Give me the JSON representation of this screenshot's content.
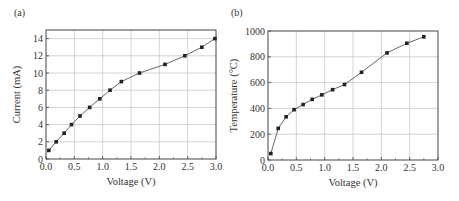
{
  "chart_data": [
    {
      "type": "line",
      "panel_label": "(a)",
      "title": "",
      "xlabel": "Voltage (V)",
      "ylabel": "Current (mA)",
      "xlim": [
        0.0,
        3.0
      ],
      "ylim": [
        0,
        15
      ],
      "xticks": [
        "0.0",
        "0.5",
        "1.0",
        "1.5",
        "2.0",
        "2.5",
        "3.0"
      ],
      "yticks": [
        "0",
        "2",
        "4",
        "6",
        "8",
        "10",
        "12",
        "14"
      ],
      "grid": true,
      "legend": null,
      "series": [
        {
          "name": "Current",
          "marker": "square",
          "x": [
            0.05,
            0.18,
            0.32,
            0.45,
            0.6,
            0.77,
            0.95,
            1.13,
            1.33,
            1.65,
            2.1,
            2.45,
            2.75,
            2.98
          ],
          "y": [
            1,
            2,
            3,
            4,
            5,
            6,
            7,
            8,
            9,
            10,
            11,
            12,
            13,
            14
          ]
        }
      ]
    },
    {
      "type": "line",
      "panel_label": "(b)",
      "title": "",
      "xlabel": "Voltage (V)",
      "ylabel": "Temperature (°C)",
      "xlim": [
        0.0,
        3.0
      ],
      "ylim": [
        0,
        1000
      ],
      "xticks": [
        "0.0",
        "0.5",
        "1.0",
        "1.5",
        "2.0",
        "2.5",
        "3.0"
      ],
      "yticks": [
        "0",
        "200",
        "400",
        "600",
        "800",
        "1000"
      ],
      "grid": true,
      "legend": null,
      "series": [
        {
          "name": "Temperature",
          "marker": "square",
          "x": [
            0.05,
            0.18,
            0.32,
            0.46,
            0.62,
            0.78,
            0.95,
            1.14,
            1.35,
            1.65,
            2.1,
            2.45,
            2.75
          ],
          "y": [
            50,
            245,
            335,
            390,
            430,
            470,
            505,
            545,
            585,
            680,
            830,
            905,
            955
          ]
        }
      ]
    }
  ]
}
